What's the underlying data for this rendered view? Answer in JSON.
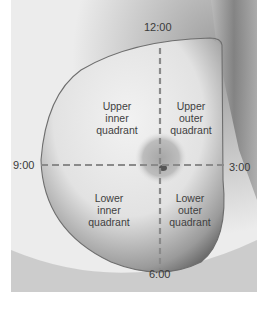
{
  "diagram": {
    "clock_labels": {
      "top": "12:00",
      "left": "9:00",
      "right": "3:00",
      "bottom": "6:00"
    },
    "quadrants": {
      "upper_inner": [
        "Upper",
        "inner",
        "quadrant"
      ],
      "upper_outer": [
        "Upper",
        "outer",
        "quadrant"
      ],
      "lower_inner": [
        "Lower",
        "inner",
        "quadrant"
      ],
      "lower_outer": [
        "Lower",
        "outer",
        "quadrant"
      ]
    },
    "colors": {
      "outline": "#6e6e6e",
      "dashed_lines": "#8a8a8a",
      "text": "#3a3a3a"
    }
  }
}
